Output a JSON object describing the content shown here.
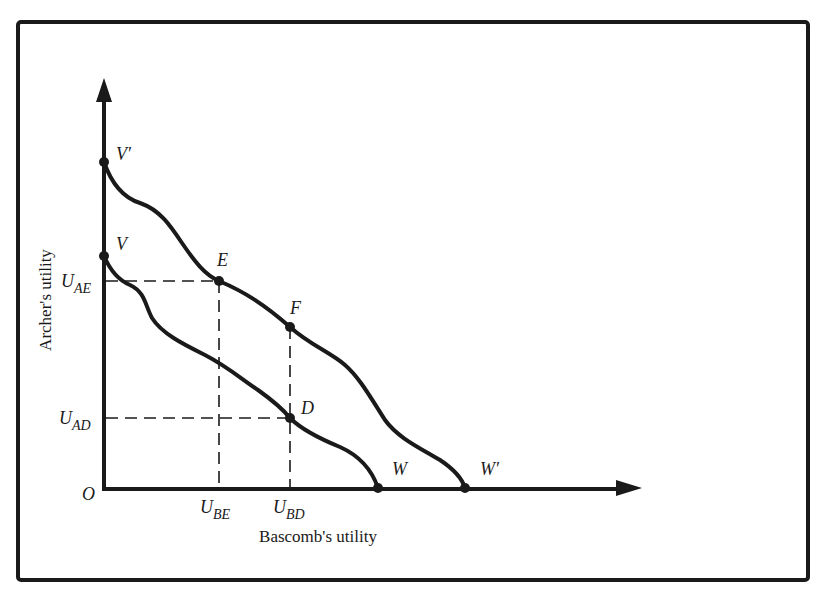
{
  "figure": {
    "x_axis_label": "Bascomb's utility",
    "y_axis_label": "Archer's utility",
    "origin_label": "O"
  },
  "points": {
    "v_prime": "V′",
    "v": "V",
    "e": "E",
    "f": "F",
    "d": "D",
    "w": "W",
    "w_prime": "W′"
  },
  "y_ticks": {
    "u_ae": {
      "main": "U",
      "sub": "AE"
    },
    "u_ad": {
      "main": "U",
      "sub": "AD"
    }
  },
  "x_ticks": {
    "u_be": {
      "main": "U",
      "sub": "BE"
    },
    "u_bd": {
      "main": "U",
      "sub": "BD"
    }
  },
  "curves": [
    {
      "name": "inner utility possibility frontier",
      "from": "V",
      "through": [
        "D"
      ],
      "to": "W"
    },
    {
      "name": "outer utility possibility frontier",
      "from": "V′",
      "through": [
        "E",
        "F"
      ],
      "to": "W′"
    }
  ],
  "colors": {
    "ink": "#1a1a1a",
    "background": "#ffffff"
  }
}
